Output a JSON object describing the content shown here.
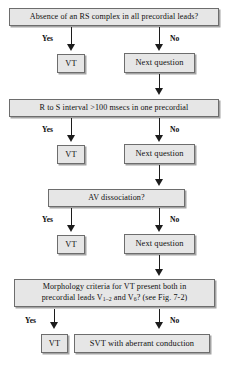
{
  "diagram": {
    "colors": {
      "box_fill": "#e6e6e6",
      "box_border": "#6d6d6d",
      "line": "#1c1c1c",
      "background": "#ffffff"
    },
    "branch_labels": {
      "yes": "Yes",
      "no": "No"
    },
    "steps": [
      {
        "id": "step1",
        "question": "Absence of an RS complex in all precordial leads?",
        "yes_outcome": "VT",
        "no_outcome": "Next question"
      },
      {
        "id": "step2",
        "question": "R to S interval >100 msecs in one precordial",
        "yes_outcome": "VT",
        "no_outcome": "Next question"
      },
      {
        "id": "step3",
        "question": "AV dissociation?",
        "yes_outcome": "VT",
        "no_outcome": "Next question"
      },
      {
        "id": "step4",
        "question_line1": "Morphology criteria for VT present both in",
        "question_line2_part1": "precordial leads V",
        "question_line2_sub1": "1–2",
        "question_line2_part2": " and V",
        "question_line2_sub2": "6",
        "question_line2_part3": "? (see Fig. 7-2)",
        "yes_outcome": "VT",
        "no_outcome": "SVT with aberrant conduction"
      }
    ]
  }
}
